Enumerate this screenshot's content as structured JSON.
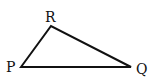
{
  "diagram": {
    "type": "triangle",
    "stroke_color": "#111111",
    "vertices": [
      {
        "name": "P",
        "x": 21,
        "y": 67,
        "label": "P",
        "label_x": 6,
        "label_y": 72
      },
      {
        "name": "R",
        "x": 51,
        "y": 26,
        "label": "R",
        "label_x": 45,
        "label_y": 22
      },
      {
        "name": "Q",
        "x": 131,
        "y": 67,
        "label": "Q",
        "label_x": 136,
        "label_y": 74
      }
    ],
    "edges": [
      [
        "P",
        "R"
      ],
      [
        "R",
        "Q"
      ],
      [
        "Q",
        "P"
      ]
    ]
  }
}
